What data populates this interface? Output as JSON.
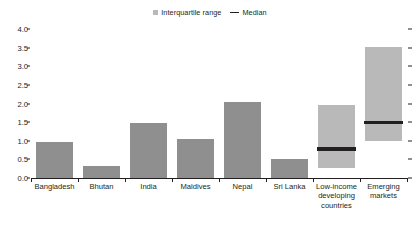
{
  "legend": {
    "iqr_label": "Interquartile range",
    "median_label": "Median"
  },
  "colors": {
    "bar": "#8f8f8f",
    "iqr_box": "#b9b9b9",
    "median_line": "#231f20",
    "axis": "#231f20",
    "background": "#ffffff"
  },
  "chart_data": {
    "type": "bar",
    "title": "",
    "xlabel": "",
    "ylabel": "",
    "ylim": [
      0.0,
      4.0
    ],
    "ytick_values": [
      0.0,
      0.5,
      1.0,
      1.5,
      2.0,
      2.5,
      3.0,
      3.5,
      4.0
    ],
    "ytick_labels": [
      "0.0",
      "0.5",
      "1.0",
      "1.5",
      "2.0",
      "2.5",
      "3.0",
      "3.5",
      "4.0"
    ],
    "grid": false,
    "legend_position": "top-center",
    "mirrored_right_ticks": true,
    "categories": [
      "Bangladesh",
      "Bhutan",
      "India",
      "Maldives",
      "Nepal",
      "Sri Lanka",
      "Low-income\ndeveloping\ncountries",
      "Emerging\nmarkets"
    ],
    "series": [
      {
        "name": "Interquartile range",
        "type": "value-bar",
        "values": [
          0.98,
          0.32,
          1.49,
          1.06,
          2.05,
          0.51,
          null,
          null
        ]
      },
      {
        "name": "Interquartile range box",
        "type": "range-box",
        "ranges": [
          null,
          null,
          null,
          null,
          null,
          null,
          [
            0.28,
            1.97
          ],
          [
            1.0,
            3.52
          ]
        ]
      },
      {
        "name": "Median",
        "type": "median-line",
        "values": [
          null,
          null,
          null,
          null,
          null,
          null,
          0.78,
          1.49
        ]
      }
    ]
  }
}
